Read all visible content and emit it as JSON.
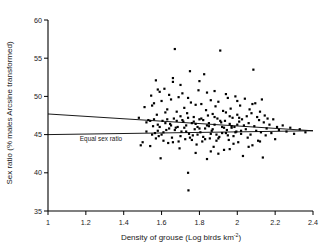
{
  "chart_data": {
    "type": "scatter",
    "title": "",
    "xlabel": "Density of grouse (Log birds km",
    "xlabel_sup": "-2",
    "xlabel_tail": ")",
    "ylabel": "Sex ratio (% males Arcsine transformed)",
    "xlim": [
      1,
      2.4
    ],
    "ylim": [
      35,
      60
    ],
    "xticks": [
      "1",
      "1.2",
      "1.4",
      "1.6",
      "1.8",
      "2",
      "2.2",
      "2.4"
    ],
    "xtick_values": [
      1,
      1.2,
      1.4,
      1.6,
      1.8,
      2,
      2.2,
      2.4
    ],
    "yticks": [
      "35",
      "40",
      "45",
      "50",
      "55",
      "60"
    ],
    "ytick_values": [
      35,
      40,
      45,
      50,
      55,
      60
    ],
    "grid": false,
    "legend": "none",
    "marker": "square",
    "marker_color": "#000000",
    "marker_size": 2.2,
    "annotations": [
      {
        "text": "Equal sex ratio",
        "x": 1.28,
        "y": 44.2
      }
    ],
    "lines": [
      {
        "name": "regression-line",
        "x": [
          1,
          2.4
        ],
        "y": [
          47.7,
          45.5
        ],
        "color": "#000000",
        "width": 0.9
      },
      {
        "name": "equal-sex-ratio-line",
        "x": [
          1,
          2.4
        ],
        "y": [
          45.0,
          45.5
        ],
        "color": "#000000",
        "width": 0.9
      }
    ],
    "points": [
      [
        1.48,
        47.2
      ],
      [
        1.49,
        43.6
      ],
      [
        1.5,
        44.0
      ],
      [
        1.51,
        48.6
      ],
      [
        1.52,
        46.6
      ],
      [
        1.53,
        46.9
      ],
      [
        1.54,
        43.5
      ],
      [
        1.545,
        50.1
      ],
      [
        1.55,
        48.8
      ],
      [
        1.555,
        46.1
      ],
      [
        1.56,
        49.1
      ],
      [
        1.565,
        45.2
      ],
      [
        1.57,
        52.1
      ],
      [
        1.575,
        47.6
      ],
      [
        1.58,
        46.3
      ],
      [
        1.585,
        44.8
      ],
      [
        1.59,
        50.6
      ],
      [
        1.595,
        41.9
      ],
      [
        1.6,
        49.4
      ],
      [
        1.605,
        46.8
      ],
      [
        1.61,
        44.2
      ],
      [
        1.615,
        51.0
      ],
      [
        1.62,
        47.9
      ],
      [
        1.625,
        45.6
      ],
      [
        1.63,
        48.3
      ],
      [
        1.635,
        43.9
      ],
      [
        1.64,
        50.2
      ],
      [
        1.645,
        46.4
      ],
      [
        1.65,
        49.6
      ],
      [
        1.655,
        44.6
      ],
      [
        1.66,
        51.9
      ],
      [
        1.665,
        47.1
      ],
      [
        1.67,
        56.2
      ],
      [
        1.675,
        45.9
      ],
      [
        1.68,
        48.0
      ],
      [
        1.685,
        46.0
      ],
      [
        1.69,
        49.9
      ],
      [
        1.695,
        43.2
      ],
      [
        1.7,
        47.4
      ],
      [
        1.705,
        45.4
      ],
      [
        1.71,
        50.4
      ],
      [
        1.715,
        46.7
      ],
      [
        1.72,
        48.5
      ],
      [
        1.725,
        44.4
      ],
      [
        1.73,
        46.2
      ],
      [
        1.735,
        47.8
      ],
      [
        1.74,
        40.0
      ],
      [
        1.742,
        37.7
      ],
      [
        1.745,
        45.1
      ],
      [
        1.75,
        53.3
      ],
      [
        1.755,
        49.2
      ],
      [
        1.76,
        46.5
      ],
      [
        1.765,
        44.9
      ],
      [
        1.77,
        47.3
      ],
      [
        1.775,
        45.7
      ],
      [
        1.78,
        48.9
      ],
      [
        1.785,
        43.7
      ],
      [
        1.79,
        46.0
      ],
      [
        1.795,
        50.8
      ],
      [
        1.8,
        47.0
      ],
      [
        1.805,
        45.3
      ],
      [
        1.81,
        49.0
      ],
      [
        1.815,
        44.1
      ],
      [
        1.82,
        46.9
      ],
      [
        1.825,
        52.9
      ],
      [
        1.83,
        45.8
      ],
      [
        1.835,
        48.2
      ],
      [
        1.84,
        41.8
      ],
      [
        1.845,
        47.5
      ],
      [
        1.85,
        46.1
      ],
      [
        1.855,
        44.5
      ],
      [
        1.86,
        49.5
      ],
      [
        1.865,
        45.5
      ],
      [
        1.87,
        47.7
      ],
      [
        1.875,
        43.4
      ],
      [
        1.88,
        46.3
      ],
      [
        1.885,
        48.7
      ],
      [
        1.89,
        45.0
      ],
      [
        1.895,
        47.1
      ],
      [
        1.9,
        49.3
      ],
      [
        1.905,
        44.7
      ],
      [
        1.91,
        56.0
      ],
      [
        1.915,
        46.6
      ],
      [
        1.92,
        45.2
      ],
      [
        1.925,
        48.1
      ],
      [
        1.93,
        43.0
      ],
      [
        1.935,
        46.8
      ],
      [
        1.94,
        47.9
      ],
      [
        1.945,
        45.6
      ],
      [
        1.95,
        49.8
      ],
      [
        1.955,
        44.3
      ],
      [
        1.96,
        46.4
      ],
      [
        1.965,
        48.4
      ],
      [
        1.97,
        45.9
      ],
      [
        1.975,
        47.2
      ],
      [
        1.98,
        43.8
      ],
      [
        1.985,
        46.0
      ],
      [
        1.99,
        50.0
      ],
      [
        1.995,
        45.4
      ],
      [
        2.0,
        47.6
      ],
      [
        2.005,
        44.0
      ],
      [
        2.01,
        46.7
      ],
      [
        2.015,
        48.8
      ],
      [
        2.02,
        45.1
      ],
      [
        2.025,
        47.0
      ],
      [
        2.03,
        42.2
      ],
      [
        2.035,
        46.2
      ],
      [
        2.04,
        49.7
      ],
      [
        2.045,
        45.7
      ],
      [
        2.05,
        47.4
      ],
      [
        2.055,
        44.6
      ],
      [
        2.06,
        46.5
      ],
      [
        2.065,
        48.3
      ],
      [
        2.07,
        45.0
      ],
      [
        2.075,
        47.8
      ],
      [
        2.08,
        43.6
      ],
      [
        2.085,
        53.5
      ],
      [
        2.09,
        46.1
      ],
      [
        2.095,
        49.1
      ],
      [
        2.1,
        45.5
      ],
      [
        2.105,
        47.3
      ],
      [
        2.11,
        44.2
      ],
      [
        2.115,
        46.9
      ],
      [
        2.12,
        48.0
      ],
      [
        2.125,
        45.3
      ],
      [
        2.13,
        49.6
      ],
      [
        2.135,
        42.0
      ],
      [
        2.14,
        46.6
      ],
      [
        2.145,
        47.5
      ],
      [
        2.15,
        44.9
      ],
      [
        2.155,
        45.8
      ],
      [
        2.16,
        47.1
      ],
      [
        2.17,
        46.3
      ],
      [
        2.18,
        45.2
      ],
      [
        2.19,
        47.0
      ],
      [
        2.2,
        44.4
      ],
      [
        2.21,
        46.0
      ],
      [
        2.22,
        45.6
      ],
      [
        2.24,
        46.2
      ],
      [
        2.26,
        45.4
      ],
      [
        2.28,
        45.9
      ],
      [
        2.3,
        45.1
      ],
      [
        2.33,
        45.7
      ],
      [
        2.36,
        45.3
      ],
      [
        1.56,
        47.0
      ],
      [
        1.58,
        45.5
      ],
      [
        1.6,
        45.0
      ],
      [
        1.62,
        46.5
      ],
      [
        1.64,
        45.8
      ],
      [
        1.66,
        44.0
      ],
      [
        1.68,
        46.8
      ],
      [
        1.7,
        44.8
      ],
      [
        1.72,
        45.9
      ],
      [
        1.74,
        47.2
      ],
      [
        1.76,
        44.3
      ],
      [
        1.78,
        46.4
      ],
      [
        1.8,
        45.8
      ],
      [
        1.82,
        44.7
      ],
      [
        1.84,
        46.2
      ],
      [
        1.86,
        45.1
      ],
      [
        1.88,
        47.3
      ],
      [
        1.9,
        44.5
      ],
      [
        1.92,
        46.0
      ],
      [
        1.94,
        45.2
      ],
      [
        1.96,
        47.4
      ],
      [
        1.98,
        44.8
      ],
      [
        2.0,
        46.3
      ],
      [
        2.02,
        45.5
      ],
      [
        1.55,
        45.0
      ],
      [
        1.57,
        44.5
      ],
      [
        1.59,
        46.0
      ],
      [
        1.61,
        45.3
      ],
      [
        1.63,
        47.0
      ],
      [
        1.65,
        46.2
      ],
      [
        1.67,
        45.6
      ],
      [
        1.69,
        44.1
      ],
      [
        1.71,
        46.9
      ],
      [
        1.73,
        45.4
      ],
      [
        1.75,
        44.6
      ],
      [
        1.77,
        46.7
      ],
      [
        1.79,
        45.0
      ],
      [
        1.81,
        47.1
      ],
      [
        1.83,
        44.4
      ],
      [
        1.85,
        46.5
      ],
      [
        1.87,
        45.7
      ],
      [
        1.89,
        44.2
      ],
      [
        1.91,
        46.8
      ],
      [
        1.93,
        45.9
      ],
      [
        1.95,
        44.9
      ],
      [
        1.97,
        46.1
      ],
      [
        1.99,
        45.3
      ],
      [
        2.01,
        47.2
      ],
      [
        1.52,
        45.4
      ],
      [
        1.54,
        46.8
      ],
      [
        1.86,
        42.8
      ],
      [
        1.9,
        42.5
      ],
      [
        1.78,
        42.6
      ],
      [
        1.96,
        43.1
      ],
      [
        2.06,
        43.4
      ],
      [
        2.12,
        44.1
      ],
      [
        1.84,
        50.5
      ],
      [
        1.7,
        51.5
      ],
      [
        1.66,
        52.4
      ],
      [
        1.58,
        50.9
      ],
      [
        1.88,
        50.7
      ],
      [
        1.94,
        50.3
      ],
      [
        2.0,
        49.4
      ],
      [
        2.08,
        49.0
      ],
      [
        1.8,
        52.0
      ],
      [
        1.74,
        49.8
      ]
    ]
  }
}
